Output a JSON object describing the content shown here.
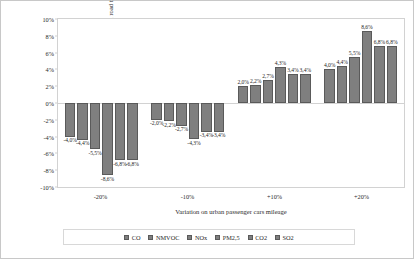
{
  "chart_data": {
    "type": "bar",
    "title": "",
    "xlabel": "Variation on urban passenger cars mileage",
    "ylabel": "Emissions variation, total road transport (%)",
    "categories": [
      "-20%",
      "-10%",
      "+10%",
      "+20%"
    ],
    "ylim": [
      -10,
      10
    ],
    "ytick_values": [
      10,
      8,
      6,
      4,
      2,
      0,
      -2,
      -4,
      -6,
      -8,
      -10
    ],
    "ytick_labels": [
      "10%",
      "8%",
      "6%",
      "4%",
      "2%",
      "0%",
      "-2%",
      "-4%",
      "-6%",
      "-8%",
      "-10%"
    ],
    "grid": false,
    "legend_position": "bottom",
    "bar_color": "#7f7f7f",
    "bar_edge_color": "#5a5a5a",
    "series": [
      {
        "name": "CO",
        "values": [
          -4.0,
          -2.0,
          2.0,
          4.0
        ],
        "labels": [
          "-4,0%",
          "-2,0%",
          "2,0%",
          "4,0%"
        ]
      },
      {
        "name": "NMVOC",
        "values": [
          -4.4,
          -2.2,
          2.2,
          4.4
        ],
        "labels": [
          "-4,4%",
          "-2,2%",
          "2,2%",
          "4,4%"
        ]
      },
      {
        "name": "NOx",
        "values": [
          -5.5,
          -2.7,
          2.7,
          5.5
        ],
        "labels": [
          "-5,5%",
          "-2,7%",
          "2,7%",
          "5,5%"
        ]
      },
      {
        "name": "PM2,5",
        "values": [
          -8.6,
          -4.3,
          4.3,
          8.6
        ],
        "labels": [
          "-8,6%",
          "-4,3%",
          "4,3%",
          "8,6%"
        ]
      },
      {
        "name": "CO2",
        "values": [
          -6.8,
          -3.4,
          3.4,
          6.8
        ],
        "labels": [
          "-6,8%",
          "-3,4%",
          "3,4%",
          "6,8%"
        ]
      },
      {
        "name": "SO2",
        "values": [
          -6.8,
          -3.4,
          3.4,
          6.8
        ],
        "labels": [
          "-6,8%",
          "-3,4%",
          "3,4%",
          "6,8%"
        ]
      }
    ]
  }
}
